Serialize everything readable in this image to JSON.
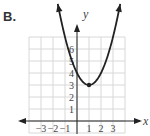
{
  "problem_label": "B.",
  "chart_data": {
    "type": "line",
    "title": "",
    "xlabel": "x",
    "ylabel": "y",
    "xlim": [
      -4,
      4
    ],
    "ylim": [
      -1,
      7
    ],
    "grid": true,
    "x_ticks": [
      -3,
      -2,
      -1,
      1,
      2,
      3
    ],
    "x_tick_labels": [
      "−3",
      "−2",
      "−1",
      "1",
      "2",
      "3"
    ],
    "y_ticks": [
      1,
      2,
      3,
      4,
      5,
      6
    ],
    "y_tick_labels": [
      "1",
      "2",
      "3",
      "4",
      "5",
      "6"
    ],
    "series": [
      {
        "name": "parabola",
        "equation": "y = (x - 1)^2 + 3",
        "vertex": [
          1,
          3
        ],
        "x": [
          -1.7,
          -1.5,
          -1,
          -0.5,
          0,
          0.5,
          1,
          1.5,
          2,
          2.5,
          3,
          3.5,
          3.7
        ],
        "y": [
          10.29,
          9.25,
          7,
          5.25,
          4,
          3.25,
          3,
          3.25,
          4,
          5.25,
          7,
          9.25,
          10.29
        ]
      }
    ],
    "colors": {
      "curve": "#222222",
      "grid": "#d8d8d8",
      "axis": "#222222"
    }
  }
}
